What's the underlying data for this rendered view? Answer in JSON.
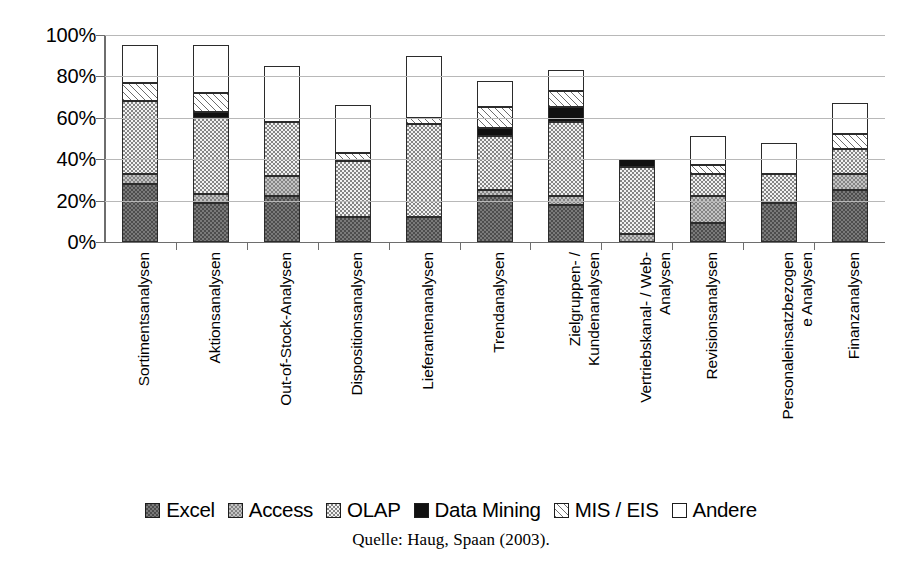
{
  "chart_data": {
    "type": "bar",
    "stacked": true,
    "title": "",
    "subtitle": "",
    "xlabel": "",
    "ylabel": "",
    "ylim": [
      0,
      100
    ],
    "y_tick_labels": [
      "0%",
      "20%",
      "40%",
      "60%",
      "80%",
      "100%"
    ],
    "y_ticks": [
      0,
      20,
      40,
      60,
      80,
      100
    ],
    "grid": true,
    "legend_position": "bottom",
    "source": "Quelle: Haug, Spaan (2003).",
    "categories": [
      "Sortimentsanalysen",
      "Aktionsanalysen",
      "Out-of-Stock-Analysen",
      "Dispositionsanalysen",
      "Lieferantenanalysen",
      "Trendanalysen",
      "Zielgruppen- /\nKundenanalysen",
      "Vertriebskanal- / Web-\nAnalysen",
      "Revisionsanalysen",
      "Personaleinsatzbezogen\ne Analysen",
      "Finanzanalysen"
    ],
    "series": [
      {
        "name": "Excel",
        "color": "#7a7a7a",
        "pattern": "dotted-dark",
        "values": [
          28,
          19,
          22,
          12,
          12,
          22,
          18,
          0,
          9,
          19,
          25
        ]
      },
      {
        "name": "Access",
        "color": "#c3c3c3",
        "pattern": "dotted-light",
        "values": [
          5,
          4,
          10,
          0,
          0,
          3,
          4,
          4,
          13,
          0,
          8
        ]
      },
      {
        "name": "OLAP",
        "color": "#f2f2f2",
        "pattern": "fine-dots",
        "values": [
          35,
          37,
          26,
          27,
          45,
          26,
          36,
          32,
          11,
          14,
          12
        ]
      },
      {
        "name": "Data Mining",
        "color": "#111111",
        "pattern": "solid-black",
        "values": [
          0,
          3,
          0,
          0,
          0,
          4,
          7,
          4,
          0,
          0,
          0
        ]
      },
      {
        "name": "MIS / EIS",
        "color": "#ffffff",
        "pattern": "diagonal-hatch",
        "values": [
          9,
          9,
          0,
          4,
          3,
          10,
          8,
          0,
          4,
          0,
          7
        ]
      },
      {
        "name": "Andere",
        "color": "#ffffff",
        "pattern": "empty",
        "values": [
          18,
          23,
          27,
          23,
          30,
          13,
          10,
          0,
          14,
          15,
          15
        ]
      }
    ],
    "bar_totals": [
      95,
      95,
      85,
      66,
      90,
      78,
      83,
      40,
      51,
      48,
      67
    ]
  },
  "legend": {
    "items": [
      {
        "label": "Excel",
        "fill_class": "fill-excel"
      },
      {
        "label": "Access",
        "fill_class": "fill-access"
      },
      {
        "label": "OLAP",
        "fill_class": "fill-olap"
      },
      {
        "label": "Data Mining",
        "fill_class": "fill-datamining"
      },
      {
        "label": "MIS / EIS",
        "fill_class": "fill-mis"
      },
      {
        "label": "Andere",
        "fill_class": "fill-andere"
      }
    ]
  },
  "source": {
    "text": "Quelle: Haug, Spaan (2003)."
  }
}
